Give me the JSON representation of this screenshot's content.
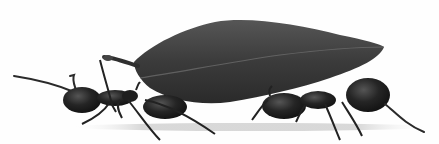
{
  "image": {
    "subject": "Two ants carrying a leaf",
    "style": "monochrome",
    "background": "#fefefe",
    "colors": {
      "leaf": "#3a3a3a",
      "leaf_highlight": "#5a5a5a",
      "leaf_vein": "#6a6a6a",
      "ant_body": "#1c1c1c",
      "ant_highlight": "#4a4a4a",
      "shadow": "#d8d8d8"
    },
    "elements": [
      "leaf",
      "ant-left",
      "ant-right",
      "ground-shadow"
    ]
  }
}
